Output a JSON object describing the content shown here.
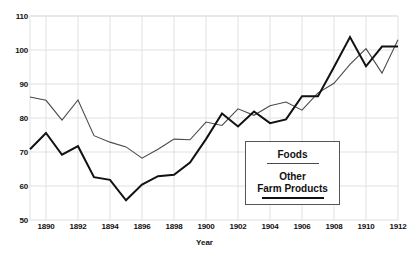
{
  "chart_data": {
    "type": "line",
    "title": "",
    "xlabel": "Year",
    "ylabel": "",
    "xlim": [
      1889,
      1912
    ],
    "ylim": [
      50,
      110
    ],
    "grid": true,
    "legend_position": "inside-lower-right",
    "y_ticks": [
      110,
      100,
      90,
      80,
      70,
      60,
      50
    ],
    "x_ticks": [
      1890,
      1892,
      1894,
      1896,
      1898,
      1900,
      1902,
      1904,
      1906,
      1908,
      1910,
      1912
    ],
    "x": [
      1889,
      1890,
      1891,
      1892,
      1893,
      1894,
      1895,
      1896,
      1897,
      1898,
      1899,
      1900,
      1901,
      1902,
      1903,
      1904,
      1905,
      1906,
      1907,
      1908,
      1909,
      1910,
      1911,
      1912
    ],
    "series": [
      {
        "name": "Foods",
        "color": "#4a4a4a",
        "width": 1.1,
        "values": [
          86.2,
          85.2,
          79.4,
          85.3,
          74.8,
          72.9,
          71.5,
          68.2,
          70.8,
          73.8,
          73.6,
          78.8,
          77.8,
          82.7,
          80.8,
          83.6,
          84.7,
          82.3,
          87.4,
          90.2,
          95.8,
          100.4,
          93.2,
          103.0
        ]
      },
      {
        "name": "Other Farm Products",
        "color": "#111111",
        "width": 2.0,
        "values": [
          70.8,
          75.6,
          69.2,
          71.7,
          62.6,
          61.8,
          55.8,
          60.4,
          62.9,
          63.3,
          66.9,
          73.8,
          81.3,
          77.5,
          81.9,
          78.5,
          79.6,
          86.4,
          86.4,
          95.0,
          103.8,
          95.2,
          101.0,
          101.0
        ]
      }
    ],
    "series_note": "Foods series spans 1889-1912 (24 points). Other Farm Products plotted 1889-1912."
  },
  "axes": {
    "y_labels": [
      "110",
      "100",
      "90",
      "80",
      "70",
      "60",
      "50"
    ],
    "x_labels": [
      "1890",
      "1892",
      "1894",
      "1896",
      "1898",
      "1900",
      "1902",
      "1904",
      "1906",
      "1908",
      "1910",
      "1912"
    ],
    "x_title": "Year"
  },
  "legend": {
    "entries": [
      {
        "label": "Foods",
        "style": "thin-rule"
      },
      {
        "label_line1": "Other",
        "label_line2": "Farm Products",
        "style": "thick-rule"
      }
    ],
    "foods_label": "Foods",
    "other_line1": "Other",
    "other_line2": "Farm Products"
  },
  "colors": {
    "background": "#ffffff",
    "grid": "#dedede",
    "foods_line": "#4a4a4a",
    "other_line": "#111111",
    "text": "#111111",
    "legend_border": "#555555"
  }
}
